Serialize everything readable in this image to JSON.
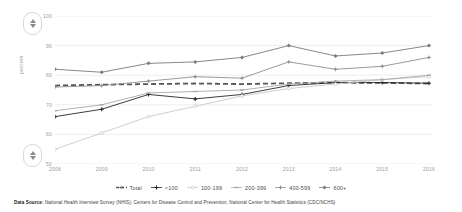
{
  "chart_data": {
    "type": "line",
    "title": "",
    "xlabel": "",
    "ylabel": "percent",
    "x": [
      2008,
      2009,
      2010,
      2011,
      2012,
      2013,
      2014,
      2015,
      2016
    ],
    "xtick_labels": [
      "2008",
      "2009",
      "2010",
      "2011",
      "2012",
      "2013",
      "2014",
      "2015",
      "2016"
    ],
    "ylim": [
      50,
      100
    ],
    "yticks": [
      50,
      60,
      70,
      80,
      90,
      100
    ],
    "ytick_labels": [
      "50",
      "60",
      "70",
      "80",
      "90",
      "100"
    ],
    "grid": "horizontal",
    "legend_position": "bottom",
    "series": [
      {
        "name": "Total",
        "style": "dashed",
        "color": "#555555",
        "marker": "none",
        "values": [
          76.5,
          76.8,
          77.0,
          77.2,
          77.0,
          77.3,
          77.5,
          77.4,
          77.2
        ]
      },
      {
        "name": "<100",
        "style": "solid",
        "color": "#262626",
        "marker": "plus",
        "values": [
          66.0,
          68.5,
          73.5,
          72.0,
          73.5,
          76.5,
          77.5,
          77.5,
          77.3
        ]
      },
      {
        "name": "100-199",
        "style": "solid",
        "color": "#c9c9c9",
        "marker": "circle",
        "values": [
          55.0,
          60.5,
          66.0,
          69.5,
          73.0,
          75.5,
          77.0,
          78.5,
          79.5
        ]
      },
      {
        "name": "200-399",
        "style": "solid",
        "color": "#a8a8a8",
        "marker": "dash",
        "values": [
          68.0,
          70.0,
          74.0,
          74.5,
          75.0,
          77.0,
          78.0,
          78.5,
          80.0
        ]
      },
      {
        "name": "400-599",
        "style": "solid",
        "color": "#8f8f8f",
        "marker": "star",
        "values": [
          76.0,
          76.5,
          78.0,
          79.5,
          79.0,
          84.5,
          82.0,
          83.0,
          86.0
        ]
      },
      {
        "name": "600+",
        "style": "solid",
        "color": "#7a7a7a",
        "marker": "diamond",
        "values": [
          82.0,
          81.0,
          84.0,
          84.5,
          86.0,
          90.0,
          86.5,
          87.5,
          90.0
        ]
      }
    ]
  },
  "controls": {
    "scroll_up_top": "scroll-up",
    "scroll_down_top": "scroll-down",
    "scroll_up_bottom": "scroll-up",
    "scroll_down_bottom": "scroll-down"
  },
  "footnote": {
    "label": "Data Source:",
    "text": " National Health Interview Survey (NHIS); Centers for Disease Control and Prevention, National Center for Health Statistics (CDC/NCHS)"
  }
}
